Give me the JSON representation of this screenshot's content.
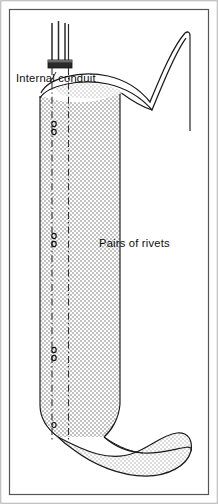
{
  "figure": {
    "name": "flattened-tube-internal-conduit-diagram",
    "background_color": "#ffffff",
    "width": 218,
    "height": 504
  },
  "frame": {
    "outer_border_color": "#9a9a9a",
    "inner_border_color": "#4a4a4a",
    "fill": "#ffffff"
  },
  "labels": {
    "internal_conduit": "Internal  conduit",
    "pairs_of_rivets": "Pairs  of  rivets"
  },
  "tube": {
    "name": "flattened-tube-body",
    "fill_color": "#d9d9d9",
    "outline_color": "#1a1a1a",
    "left_edge_x": 40,
    "right_edge_x": 120,
    "top_y": 88,
    "bottom_y": 432,
    "shading": "halftone-stipple"
  },
  "conduit": {
    "name": "internal-conduit-tubes",
    "tube_count": 3,
    "tube_color": "#2b2b2b",
    "collar_color": "#1a1a1a",
    "top_y": 22,
    "collar_y": 60
  },
  "centerlines": {
    "style": "dash-dot",
    "color": "#303030",
    "x_positions": [
      52,
      68
    ],
    "top_y": 96,
    "bottom_y": 440
  },
  "rivets": {
    "name": "pairs-of-rivets",
    "marker_color": "#1a1a1a",
    "radius": 2.1,
    "pair_gap": 7,
    "x": 54,
    "pair_y_positions": [
      125,
      237,
      351,
      425
    ]
  },
  "top_end": {
    "name": "twisted-open-top-end",
    "description": "saddle-shaped open end sweeping up to the right",
    "apex_x": 185,
    "apex_y": 32
  },
  "bottom_end": {
    "name": "twisted-flattened-bottom-end",
    "description": "flattened twisted end forming an elliptical lobe to the right",
    "lobe_right_x": 192,
    "lobe_y": 466
  }
}
